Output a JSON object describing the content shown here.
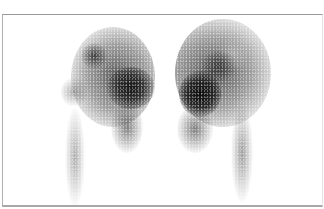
{
  "image": {
    "kind": "grayscale nuclear medicine scan",
    "description": "Two symmetric kidney-shaped uptake regions with darker cortical hot spots and diffuse tracer tails extending downward (ureters)",
    "colors": {
      "background": "#ffffff",
      "frame_border": "#a8a8a8",
      "uptake_dark": "#1a1a1a",
      "uptake_mid": "#555555",
      "uptake_light": "#9a9a9a"
    }
  }
}
